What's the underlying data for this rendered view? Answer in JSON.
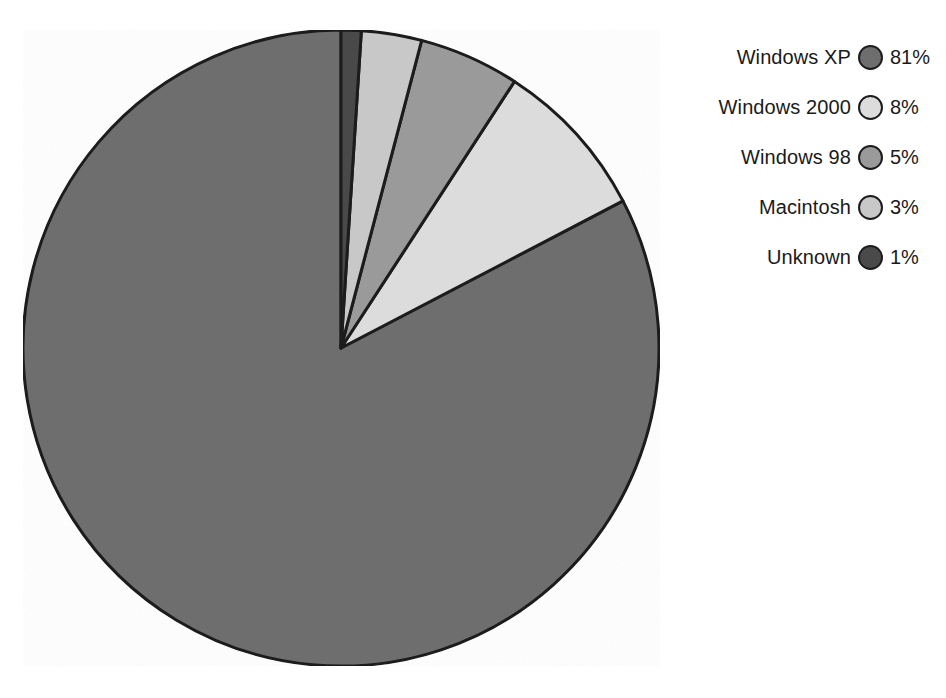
{
  "chart_data": {
    "type": "pie",
    "title": "",
    "subtitle": "",
    "xlabel": "",
    "ylabel": "",
    "grid": false,
    "legend_position": "right",
    "units": "%",
    "start_angle_deg": 90,
    "direction": "counterclockwise",
    "categories": [
      "Windows XP",
      "Windows 2000",
      "Windows 98",
      "Macintosh",
      "Unknown"
    ],
    "values": [
      81,
      8,
      5,
      3,
      1
    ],
    "slices": [
      {
        "label": "Windows XP",
        "value": 81,
        "value_text": "81%",
        "color": "#6e6e6e"
      },
      {
        "label": "Windows 2000",
        "value": 8,
        "value_text": "8%",
        "color": "#dcdcdc"
      },
      {
        "label": "Windows 98",
        "value": 5,
        "value_text": "5%",
        "color": "#9a9a9a"
      },
      {
        "label": "Macintosh",
        "value": 3,
        "value_text": "3%",
        "color": "#c8c8c8"
      },
      {
        "label": "Unknown",
        "value": 1,
        "value_text": "1%",
        "color": "#4a4a4a"
      }
    ]
  },
  "legend": {
    "items": [
      {
        "label": "Windows XP",
        "value_text": "81%",
        "color": "#6e6e6e"
      },
      {
        "label": "Windows 2000",
        "value_text": "8%",
        "color": "#dcdcdc"
      },
      {
        "label": "Windows 98",
        "value_text": "5%",
        "color": "#9a9a9a"
      },
      {
        "label": "Macintosh",
        "value_text": "3%",
        "color": "#c8c8c8"
      },
      {
        "label": "Unknown",
        "value_text": "1%",
        "color": "#4a4a4a"
      }
    ]
  },
  "style": {
    "background": "#ffffff",
    "outline": "#1c1c1c",
    "text": "#1a1a1a"
  }
}
